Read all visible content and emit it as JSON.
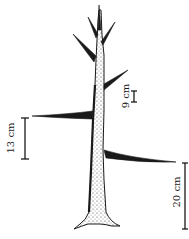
{
  "diagram": {
    "colors": {
      "ink": "#1a1a1a",
      "background": "#ffffff"
    },
    "measurements": [
      {
        "id": "left-branch-height",
        "label": "13 cm",
        "value": 13,
        "unit": "cm"
      },
      {
        "id": "upper-branch-gap",
        "label": "9 cm",
        "value": 9,
        "unit": "cm"
      },
      {
        "id": "right-branch-height",
        "label": "20 cm",
        "value": 20,
        "unit": "cm"
      }
    ]
  }
}
